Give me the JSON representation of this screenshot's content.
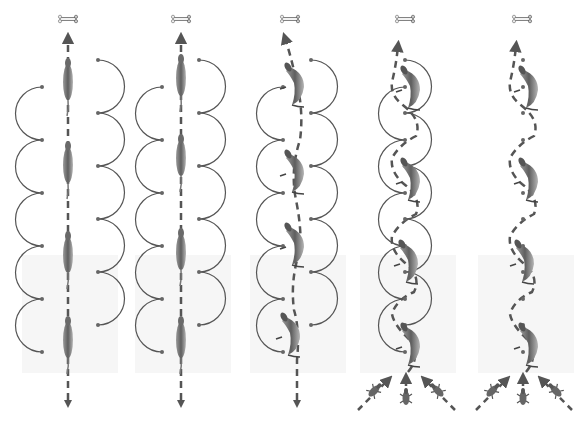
{
  "diagram": {
    "type": "locomotion-path-comparison",
    "panels": [
      {
        "id": "p1",
        "cx": 68,
        "goal_icon": "bone-icon",
        "path": "straight",
        "arcs": "split-outer",
        "start": "single-arrow",
        "animals": 4
      },
      {
        "id": "p2",
        "cx": 181,
        "goal_icon": "bone-icon",
        "path": "straight",
        "arcs": "split-near",
        "start": "single-arrow",
        "animals": 4
      },
      {
        "id": "p3",
        "cx": 297,
        "goal_icon": "bone-icon",
        "path": "slight-weave",
        "arcs": "split-near",
        "start": "single-arrow",
        "animals": 4
      },
      {
        "id": "p4",
        "cx": 405,
        "goal_icon": "bone-icon",
        "path": "sinuous",
        "arcs": "interlocked",
        "start": "three-approach-arrows",
        "animals": 4
      },
      {
        "id": "p5",
        "cx": 523,
        "goal_icon": "bone-icon",
        "path": "sinuous",
        "arcs": "dots-only",
        "start": "three-approach-arrows",
        "animals": 4
      }
    ],
    "colors": {
      "path": "#555555",
      "arc": "#555555",
      "dot": "#666666",
      "animal": "#7a7a7a",
      "floor": "#f6f6f6"
    }
  }
}
